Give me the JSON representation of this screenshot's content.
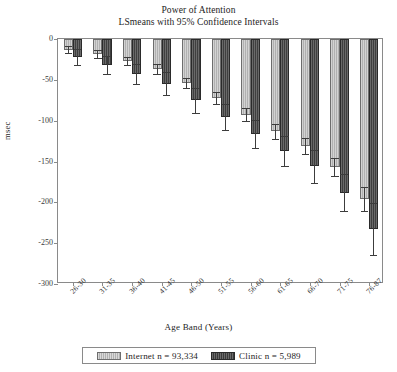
{
  "chart_data": {
    "type": "bar",
    "title": "Power of Attention",
    "subtitle": "LSmeans with 95% Confidence Intervals",
    "xlabel": "Age Band (Years)",
    "ylabel": "msec",
    "ylim": [
      -300,
      0
    ],
    "ytick_values": [
      0,
      -50,
      -100,
      -150,
      -200,
      -250,
      -300
    ],
    "ytick_labels": [
      "0",
      "-50",
      "-100",
      "-150",
      "-200",
      "-250",
      "-300"
    ],
    "grid": false,
    "orientation": "vertical-negative",
    "legend_position": "bottom-outside",
    "categories": [
      "26-30",
      "31-35",
      "36-40",
      "41-45",
      "46-50",
      "51-55",
      "56-60",
      "61-65",
      "66-70",
      "71-75",
      "76-87"
    ],
    "series": [
      {
        "name": "Internet n = 93,334",
        "key": "internet",
        "color": "#b7b7b7",
        "values": [
          -13,
          -18,
          -27,
          -37,
          -54,
          -72,
          -93,
          -113,
          -131,
          -157,
          -196
        ],
        "ci_low": [
          -17,
          -23,
          -32,
          -43,
          -60,
          -79,
          -101,
          -122,
          -141,
          -168,
          -211
        ],
        "ci_high": [
          -9,
          -13,
          -22,
          -31,
          -48,
          -65,
          -85,
          -104,
          -121,
          -146,
          -181
        ]
      },
      {
        "name": "Clinic n = 5,989",
        "key": "clinic",
        "color": "#555555",
        "values": [
          -22,
          -32,
          -43,
          -55,
          -75,
          -95,
          -116,
          -137,
          -156,
          -188,
          -233
        ],
        "ci_low": [
          -32,
          -43,
          -55,
          -69,
          -90,
          -111,
          -133,
          -155,
          -176,
          -211,
          -265
        ],
        "ci_high": [
          -12,
          -21,
          -31,
          -41,
          -60,
          -79,
          -99,
          -119,
          -136,
          -165,
          -201
        ]
      }
    ]
  },
  "legend": {
    "items": [
      {
        "label": "Internet n = 93,334",
        "swatch": "internet"
      },
      {
        "label": "Clinic n = 5,989",
        "swatch": "clinic"
      }
    ]
  },
  "colors": {
    "internet_bar": "#b7b7b7",
    "clinic_bar": "#555555",
    "axis": "#8a8a8a",
    "text": "#1d1d1d",
    "error_bar": "#3c3c3c",
    "background": "#ffffff"
  }
}
